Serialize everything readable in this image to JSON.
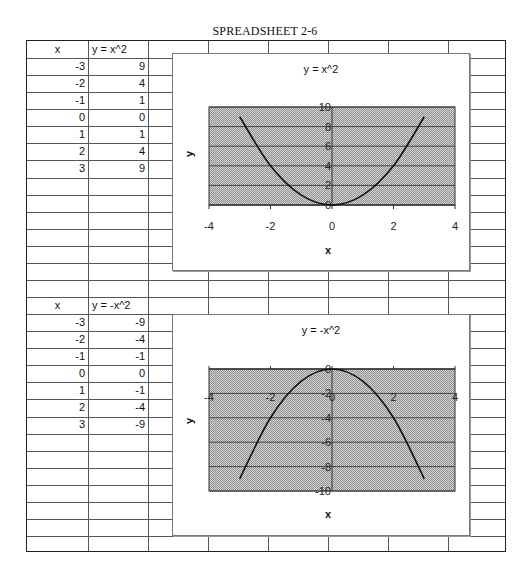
{
  "page_title": "SPREADSHEET 2-6",
  "table1": {
    "headers": [
      "x",
      "y = x^2"
    ],
    "rows": [
      [
        "-3",
        "9"
      ],
      [
        "-2",
        "4"
      ],
      [
        "-1",
        "1"
      ],
      [
        "0",
        "0"
      ],
      [
        "1",
        "1"
      ],
      [
        "2",
        "4"
      ],
      [
        "3",
        "9"
      ]
    ]
  },
  "table2": {
    "headers": [
      "x",
      "y = -x^2"
    ],
    "rows": [
      [
        "-3",
        "-9"
      ],
      [
        "-2",
        "-4"
      ],
      [
        "-1",
        "-1"
      ],
      [
        "0",
        "0"
      ],
      [
        "1",
        "-1"
      ],
      [
        "2",
        "-4"
      ],
      [
        "3",
        "-9"
      ]
    ]
  },
  "chart1": {
    "title": "y = x^2",
    "xlabel": "x",
    "ylabel": "y",
    "x_ticks": [
      "-4",
      "-2",
      "0",
      "2",
      "4"
    ],
    "y_ticks": [
      "0",
      "2",
      "4",
      "6",
      "8",
      "10"
    ]
  },
  "chart2": {
    "title": "y = -x^2",
    "xlabel": "x",
    "ylabel": "y",
    "x_ticks": [
      "-4",
      "-2",
      "0",
      "2",
      "4"
    ],
    "y_ticks": [
      "0",
      "-2",
      "-4",
      "-6",
      "-8",
      "-10"
    ]
  },
  "colors": {
    "plot_fill": "#bdbdbd",
    "line": "#111111",
    "grid": "#444444"
  },
  "chart_data": [
    {
      "type": "line",
      "title": "y = x^2",
      "xlabel": "x",
      "ylabel": "y",
      "x": [
        -3,
        -2,
        -1,
        0,
        1,
        2,
        3
      ],
      "series": [
        {
          "name": "y = x^2",
          "values": [
            9,
            4,
            1,
            0,
            1,
            4,
            9
          ]
        }
      ],
      "xlim": [
        -4,
        4
      ],
      "ylim": [
        0,
        10
      ],
      "x_ticks": [
        -4,
        -2,
        0,
        2,
        4
      ],
      "y_ticks": [
        0,
        2,
        4,
        6,
        8,
        10
      ],
      "grid": true,
      "smooth": true
    },
    {
      "type": "line",
      "title": "y = -x^2",
      "xlabel": "x",
      "ylabel": "y",
      "x": [
        -3,
        -2,
        -1,
        0,
        1,
        2,
        3
      ],
      "series": [
        {
          "name": "y = -x^2",
          "values": [
            -9,
            -4,
            -1,
            0,
            -1,
            -4,
            -9
          ]
        }
      ],
      "xlim": [
        -4,
        4
      ],
      "ylim": [
        -10,
        0
      ],
      "x_ticks": [
        -4,
        -2,
        0,
        2,
        4
      ],
      "y_ticks": [
        0,
        -2,
        -4,
        -6,
        -8,
        -10
      ],
      "grid": true,
      "smooth": true
    }
  ]
}
